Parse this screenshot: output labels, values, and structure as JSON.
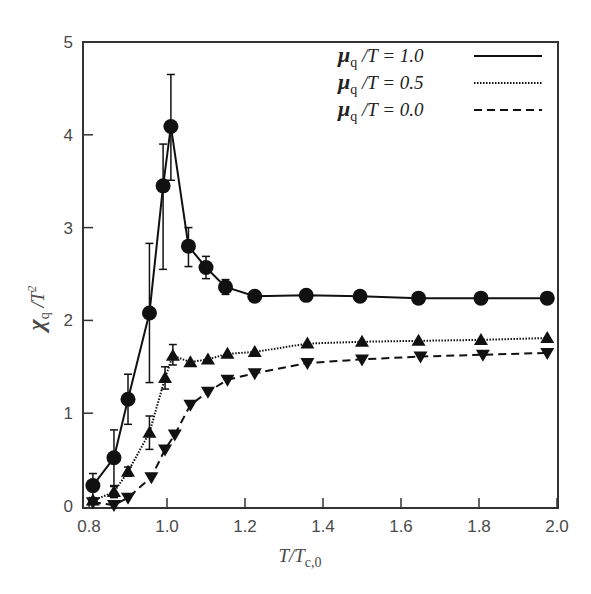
{
  "chart_data": {
    "type": "line",
    "title": "",
    "xlabel": "T/T_c,0",
    "ylabel": "χ_q/T^2",
    "xlim": [
      0.8,
      2.0
    ],
    "ylim": [
      0,
      5
    ],
    "xticks": [
      "0.8",
      "1.0",
      "1.2",
      "1.4",
      "1.6",
      "1.8",
      "2.0"
    ],
    "yticks": [
      "0",
      "1",
      "2",
      "3",
      "4",
      "5"
    ],
    "grid": false,
    "legend_position": "upper right",
    "series": [
      {
        "name": "μq/T = 1.0",
        "line_style": "solid",
        "marker": "circle",
        "x": [
          0.81,
          0.864,
          0.9,
          0.955,
          0.99,
          1.01,
          1.055,
          1.1,
          1.15,
          1.225,
          1.357,
          1.495,
          1.645,
          1.805,
          1.975
        ],
        "y": [
          0.22,
          0.52,
          1.15,
          2.08,
          3.45,
          4.09,
          2.8,
          2.57,
          2.36,
          2.26,
          2.27,
          2.26,
          2.24,
          2.24,
          2.24
        ],
        "err_low": [
          0.13,
          0.3,
          0.27,
          0.75,
          0.9,
          0.58,
          0.22,
          0.12,
          0.08,
          0,
          0,
          0,
          0,
          0,
          0
        ],
        "err_high": [
          0.13,
          0.3,
          0.27,
          0.75,
          0.45,
          0.56,
          0.2,
          0.12,
          0.08,
          0,
          0,
          0,
          0,
          0,
          0
        ]
      },
      {
        "name": "μq/T = 0.5",
        "line_style": "dotted",
        "marker": "triangle-up",
        "x": [
          0.81,
          0.864,
          0.9,
          0.955,
          0.995,
          1.015,
          1.06,
          1.105,
          1.155,
          1.225,
          1.36,
          1.5,
          1.645,
          1.805,
          1.975
        ],
        "y": [
          0.06,
          0.15,
          0.37,
          0.79,
          1.38,
          1.62,
          1.55,
          1.58,
          1.64,
          1.66,
          1.75,
          1.77,
          1.78,
          1.79,
          1.81
        ],
        "err_low": [
          0,
          0.06,
          0.05,
          0.18,
          0.12,
          0.1,
          0,
          0,
          0,
          0,
          0,
          0,
          0,
          0,
          0
        ],
        "err_high": [
          0,
          0.06,
          0.05,
          0.18,
          0.12,
          0.12,
          0,
          0,
          0,
          0,
          0,
          0,
          0,
          0,
          0
        ]
      },
      {
        "name": "μq/T = 0.0",
        "line_style": "dashed",
        "marker": "triangle-down",
        "x": [
          0.81,
          0.864,
          0.9,
          0.96,
          0.995,
          1.02,
          1.06,
          1.105,
          1.155,
          1.225,
          1.36,
          1.5,
          1.65,
          1.81,
          1.975
        ],
        "y": [
          0.04,
          0.01,
          0.09,
          0.31,
          0.61,
          0.77,
          1.09,
          1.23,
          1.36,
          1.43,
          1.54,
          1.58,
          1.61,
          1.63,
          1.65
        ],
        "err_low": [
          0,
          0,
          0,
          0,
          0,
          0,
          0,
          0,
          0,
          0,
          0,
          0,
          0,
          0,
          0
        ],
        "err_high": [
          0,
          0,
          0,
          0,
          0,
          0,
          0,
          0,
          0,
          0,
          0,
          0,
          0,
          0,
          0
        ]
      }
    ]
  },
  "legend": {
    "items": [
      {
        "symbol": "μ",
        "sub": "q",
        "rest": " /T = 1.0",
        "style": "solid"
      },
      {
        "symbol": "μ",
        "sub": "q",
        "rest": " /T = 0.5",
        "style": "dotted"
      },
      {
        "symbol": "μ",
        "sub": "q",
        "rest": " /T = 0.0",
        "style": "dashed"
      }
    ]
  },
  "axes": {
    "x_title_main": "T/T",
    "x_title_sub": "c,0",
    "y_title_main": "χ",
    "y_title_sub": "q",
    "y_title_rest": " /T",
    "y_title_sup": "2"
  }
}
